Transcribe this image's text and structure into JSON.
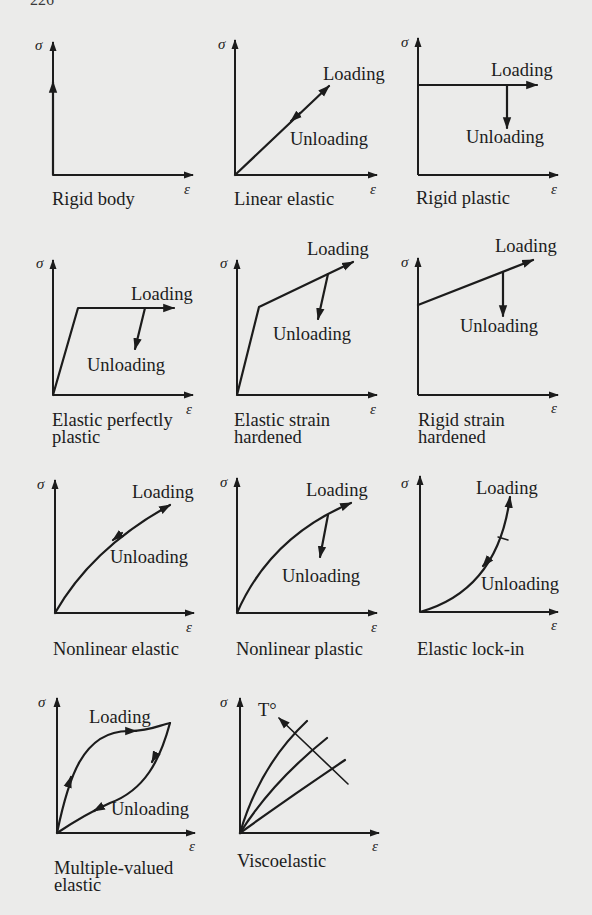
{
  "page": {
    "number_fragment": "226"
  },
  "axes": {
    "y_symbol": "σ",
    "x_symbol": "ε"
  },
  "annotations": {
    "loading": "Loading",
    "unloading": "Unloading",
    "temperature": "T°"
  },
  "panels": [
    {
      "id": "rigid-body",
      "caption": [
        "Rigid body"
      ]
    },
    {
      "id": "linear-elastic",
      "caption": [
        "Linear elastic"
      ]
    },
    {
      "id": "rigid-plastic",
      "caption": [
        "Rigid plastic"
      ]
    },
    {
      "id": "elastic-perfectly-plastic",
      "caption": [
        "Elastic perfectly",
        "plastic"
      ]
    },
    {
      "id": "elastic-strain-hardened",
      "caption": [
        "Elastic strain",
        "hardened"
      ]
    },
    {
      "id": "rigid-strain-hardened",
      "caption": [
        "Rigid strain",
        "hardened"
      ]
    },
    {
      "id": "nonlinear-elastic",
      "caption": [
        "Nonlinear elastic"
      ]
    },
    {
      "id": "nonlinear-plastic",
      "caption": [
        "Nonlinear plastic"
      ]
    },
    {
      "id": "elastic-lock-in",
      "caption": [
        "Elastic lock-in"
      ]
    },
    {
      "id": "multiple-valued-elastic",
      "caption": [
        "Multiple-valued",
        "elastic"
      ]
    },
    {
      "id": "viscoelastic",
      "caption": [
        "Viscoelastic"
      ]
    }
  ],
  "colors": {
    "background": "#ebebea",
    "ink": "#1c1c1c"
  }
}
